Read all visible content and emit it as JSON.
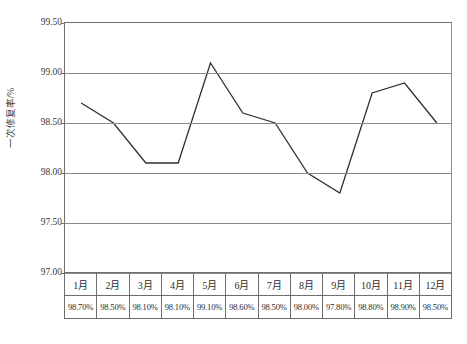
{
  "chart_data": {
    "type": "line",
    "title": "",
    "xlabel": "",
    "ylabel": "一次修复率/%",
    "ylim": [
      97.0,
      99.5
    ],
    "ytick_labels": [
      "99.50",
      "99.00",
      "98.50",
      "98.00",
      "97.50",
      "97.00"
    ],
    "ytick_values": [
      99.5,
      99.0,
      98.5,
      98.0,
      97.5,
      97.0
    ],
    "grid": true,
    "legend": "none",
    "categories": [
      "1月",
      "2月",
      "3月",
      "4月",
      "5月",
      "6月",
      "7月",
      "8月",
      "9月",
      "10月",
      "11月",
      "12月"
    ],
    "values": [
      98.7,
      98.5,
      98.1,
      98.1,
      99.1,
      98.6,
      98.5,
      98.0,
      97.8,
      98.8,
      98.9,
      98.5
    ],
    "value_labels": [
      "98.70%",
      "98.50%",
      "98.10%",
      "98.10%",
      "99.10%",
      "98.60%",
      "98.50%",
      "98.00%",
      "97.80%",
      "98.80%",
      "98.90%",
      "98.50%"
    ],
    "series": [
      {
        "name": "一次修复率",
        "values": [
          98.7,
          98.5,
          98.1,
          98.1,
          99.1,
          98.6,
          98.5,
          98.0,
          97.8,
          98.8,
          98.9,
          98.5
        ]
      }
    ],
    "colors": {
      "line": "#303030",
      "grid": "#8a8a8a",
      "axis": "#6f6f6f",
      "text": "#2b2b2b",
      "background": "#ffffff"
    }
  },
  "table": {
    "month_row": [
      "1月",
      "2月",
      "3月",
      "4月",
      "5月",
      "6月",
      "7月",
      "8月",
      "9月",
      "10月",
      "11月",
      "12月"
    ],
    "value_row": [
      "98.70%",
      "98.50%",
      "98.10%",
      "98.10%",
      "99.10%",
      "98.60%",
      "98.50%",
      "98.00%",
      "97.80%",
      "98.80%",
      "98.90%",
      "98.50%"
    ]
  }
}
